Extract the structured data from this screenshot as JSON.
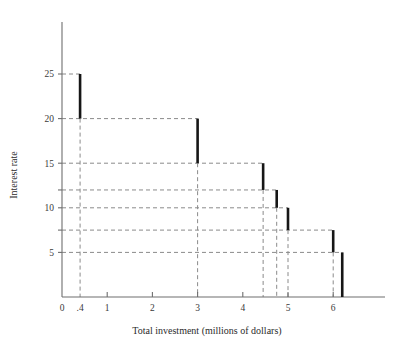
{
  "chart_data": {
    "type": "line",
    "title": "",
    "xlabel": "Total investment (millions of dollars)",
    "ylabel": "Interest rate",
    "xlim": [
      0,
      7.2
    ],
    "ylim": [
      0,
      28
    ],
    "grid": "dashed-guides",
    "legend": "none",
    "x_ticks": [
      {
        "value": 0,
        "label": "0"
      },
      {
        "value": 0.4,
        "label": ".4"
      },
      {
        "value": 1,
        "label": "1"
      },
      {
        "value": 2,
        "label": "2"
      },
      {
        "value": 3,
        "label": "3"
      },
      {
        "value": 4,
        "label": "4"
      },
      {
        "value": 5,
        "label": "5"
      },
      {
        "value": 6,
        "label": "6"
      }
    ],
    "y_ticks": [
      {
        "value": 5,
        "label": "5"
      },
      {
        "value": 7.5,
        "label": ""
      },
      {
        "value": 10,
        "label": "10"
      },
      {
        "value": 12,
        "label": ""
      },
      {
        "value": 15,
        "label": "15"
      },
      {
        "value": 20,
        "label": "20"
      },
      {
        "value": 25,
        "label": "25"
      }
    ],
    "steps": [
      {
        "x_start": 0,
        "x_end": 0.4,
        "rate": 25
      },
      {
        "x_start": 0.4,
        "x_end": 3.0,
        "rate": 20
      },
      {
        "x_start": 3.0,
        "x_end": 4.45,
        "rate": 15
      },
      {
        "x_start": 4.45,
        "x_end": 4.75,
        "rate": 12
      },
      {
        "x_start": 4.75,
        "x_end": 5.0,
        "rate": 10
      },
      {
        "x_start": 5.0,
        "x_end": 6.0,
        "rate": 7.5
      },
      {
        "x_start": 6.0,
        "x_end": 6.2,
        "rate": 5
      }
    ],
    "drops": [
      {
        "x": 0.4,
        "from": 25,
        "to": 20
      },
      {
        "x": 3.0,
        "from": 20,
        "to": 15
      },
      {
        "x": 4.45,
        "from": 15,
        "to": 12
      },
      {
        "x": 4.75,
        "from": 12,
        "to": 10
      },
      {
        "x": 5.0,
        "from": 10,
        "to": 7.5
      },
      {
        "x": 6.0,
        "from": 7.5,
        "to": 5
      },
      {
        "x": 6.2,
        "from": 5,
        "to": 0
      }
    ],
    "colors": {
      "curve": "#161616",
      "guide": "#8a8a8a",
      "axis": "#6e6e6e",
      "background": "#ffffff"
    }
  }
}
